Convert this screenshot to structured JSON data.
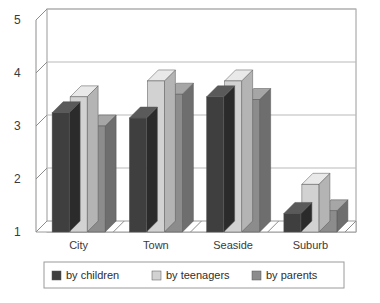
{
  "chart_data": {
    "type": "bar",
    "title": "",
    "subtitle": "",
    "xlabel": "",
    "ylabel": "",
    "categories": [
      "City",
      "Town",
      "Seaside",
      "Suburb"
    ],
    "series": [
      {
        "name": "by children",
        "values": [
          3.25,
          3.15,
          3.55,
          1.35
        ],
        "color": "#3f3f3f"
      },
      {
        "name": "by teenagers",
        "values": [
          3.55,
          3.85,
          3.85,
          1.9
        ],
        "color": "#d2d2d2"
      },
      {
        "name": "by parents",
        "values": [
          3.0,
          3.6,
          3.5,
          1.4
        ],
        "color": "#8c8c8c"
      }
    ],
    "ylim": [
      1,
      5
    ],
    "yticks": [
      "1",
      "2",
      "3",
      "4",
      "5"
    ],
    "grid": true,
    "legend_position": "bottom",
    "style": "3d-column"
  },
  "axis": {
    "y_tick_1": "1",
    "y_tick_2": "2",
    "y_tick_3": "3",
    "y_tick_4": "4",
    "y_tick_5": "5"
  },
  "categories": {
    "c0": "City",
    "c1": "Town",
    "c2": "Seaside",
    "c3": "Suburb"
  },
  "legend": {
    "item0": "by children",
    "item1": "by teenagers",
    "item2": "by parents"
  },
  "colors": {
    "children_front": "#3f3f3f",
    "children_top": "#5a5a5a",
    "children_side": "#2b2b2b",
    "teenagers_front": "#d2d2d2",
    "teenagers_top": "#e9e9e9",
    "teenagers_side": "#b4b4b4",
    "parents_front": "#8c8c8c",
    "parents_top": "#a6a6a6",
    "parents_side": "#6e6e6e",
    "grid": "#b9b9b9",
    "axis": "#8d8d8d",
    "frame": "#9a9a9a",
    "floor": "#9e9e9e",
    "text": "#3a3a3a"
  }
}
